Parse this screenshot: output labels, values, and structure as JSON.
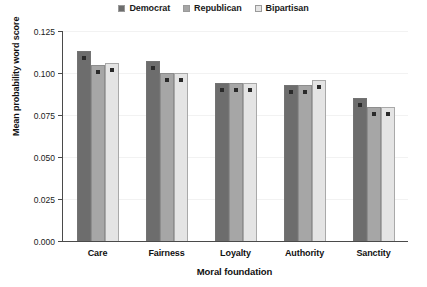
{
  "chart_data": {
    "type": "bar",
    "title": "",
    "xlabel": "Moral foundation",
    "ylabel": "Mean probability word score",
    "categories": [
      "Care",
      "Fairness",
      "Loyalty",
      "Authority",
      "Sanctity"
    ],
    "series": [
      {
        "name": "Democrat",
        "color": "#6d6d6d",
        "values": [
          0.113,
          0.107,
          0.094,
          0.093,
          0.085
        ]
      },
      {
        "name": "Republican",
        "color": "#a6a6a6",
        "values": [
          0.105,
          0.1,
          0.094,
          0.093,
          0.08
        ]
      },
      {
        "name": "Bipartisan",
        "color": "#e4e4e4",
        "values": [
          0.106,
          0.1,
          0.094,
          0.096,
          0.08
        ]
      }
    ],
    "ylim": [
      0.0,
      0.125
    ],
    "y_ticks": [
      0.0,
      0.025,
      0.05,
      0.075,
      0.1,
      0.125
    ],
    "y_tick_labels": [
      "0.000",
      "0.025",
      "0.050",
      "0.075",
      "0.100",
      "0.125"
    ],
    "grid": true,
    "legend_position": "top-center",
    "error_bars": true
  },
  "legend": {
    "entries": [
      {
        "label": "Democrat"
      },
      {
        "label": "Republican"
      },
      {
        "label": "Bipartisan"
      }
    ]
  }
}
